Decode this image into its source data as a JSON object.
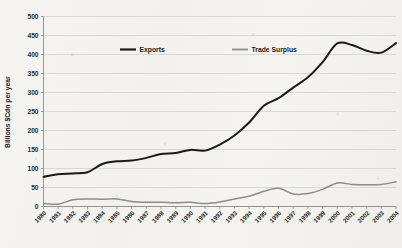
{
  "chart_data": {
    "type": "line",
    "title": "",
    "xlabel": "",
    "ylabel": "Billions $Cdn per year",
    "ylim": [
      0,
      500
    ],
    "yticks": [
      0,
      50,
      100,
      150,
      200,
      250,
      300,
      350,
      400,
      450,
      500
    ],
    "grid": true,
    "legend_position": "top-center-inside",
    "categories": [
      "1980",
      "1981",
      "1982",
      "1983",
      "1984",
      "1985",
      "1986",
      "1987",
      "1988",
      "1989",
      "1990",
      "1991",
      "1992",
      "1993",
      "1994",
      "1995",
      "1996",
      "1997",
      "1998",
      "1999",
      "2000",
      "2001",
      "2002",
      "2003",
      "2004"
    ],
    "series": [
      {
        "name": "Exports",
        "color": "#1a1a1a",
        "values": [
          78,
          85,
          87,
          90,
          112,
          119,
          121,
          128,
          138,
          141,
          149,
          147,
          163,
          187,
          221,
          265,
          285,
          313,
          340,
          380,
          429,
          425,
          410,
          405,
          430
        ]
      },
      {
        "name": "Trade Surplus",
        "color": "#8c8c8c",
        "values": [
          8,
          6,
          18,
          20,
          19,
          20,
          13,
          11,
          11,
          10,
          11,
          8,
          12,
          20,
          27,
          40,
          48,
          33,
          34,
          45,
          62,
          58,
          57,
          58,
          65
        ]
      }
    ]
  },
  "legend": {
    "items": [
      {
        "label": "Exports",
        "color": "#1a1a1a"
      },
      {
        "label": "Trade Surplus",
        "color": "#8c8c8c"
      }
    ]
  },
  "axes": {
    "y_title": "Billions $Cdn per year"
  }
}
